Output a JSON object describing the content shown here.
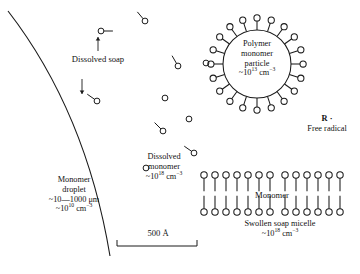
{
  "figure": {
    "type": "schematic-diagram",
    "background_color": "#ffffff",
    "line_color": "#1a1a1a"
  },
  "labels": {
    "dissolved_soap": "Dissolved soap",
    "dissolved_monomer_l1": "Dissolved",
    "dissolved_monomer_l2": "monomer",
    "dissolved_monomer_conc": "~10",
    "dissolved_monomer_conc_exp": "18",
    "dissolved_monomer_conc_unit": " cm",
    "dissolved_monomer_unit_exp": "−3",
    "monomer_droplet_l1": "Monomer",
    "monomer_droplet_l2": "droplet",
    "monomer_droplet_size": "~10—1000 μm",
    "monomer_droplet_conc": "~10",
    "monomer_droplet_conc_exp": "10",
    "monomer_droplet_unit": " cm",
    "monomer_droplet_unit_exp": "−3",
    "polymer_l1": "Polymer",
    "polymer_l2": "monomer",
    "polymer_l3": "particle",
    "polymer_conc": "~10",
    "polymer_conc_exp": "13",
    "polymer_unit": " cm",
    "polymer_unit_exp": "−3",
    "free_radical_symbol": "R ·",
    "free_radical_text": "Free radical",
    "monomer_mid": "Monomer",
    "micelle_title": "Swollen soap micelle",
    "micelle_conc": "~10",
    "micelle_conc_exp": "18",
    "micelle_unit": " cm",
    "micelle_unit_exp": "−3",
    "scale_value": "500 Å"
  },
  "chart_data": {
    "type": "scatter",
    "droplet_arc": {
      "description": "large monomer droplet boundary arc",
      "start": [
        8,
        11
      ],
      "control": [
        92,
        120
      ],
      "end": [
        110,
        256
      ]
    },
    "polymer_particle": {
      "center": [
        257,
        64
      ],
      "radius": 34,
      "soap_molecule_count": 20,
      "tail_length": 9,
      "head_radius": 3.1
    },
    "free_radical": {
      "x": 324,
      "y": 116
    },
    "scale_bar": {
      "x1": 117,
      "x2": 197,
      "y": 246,
      "tick_height": 6,
      "label": "500 Å"
    },
    "micelle": {
      "row_top_y": 175,
      "row_bottom_y": 212,
      "x_positions": [
        204,
        215,
        226,
        237,
        248,
        259,
        270,
        285,
        296,
        307,
        318,
        329,
        340
      ],
      "stem_length": 13,
      "head_radius": 3.2
    },
    "soap_molecules": [
      {
        "cx": 101,
        "cy": 31,
        "angle": 0
      },
      {
        "cx": 145,
        "cy": 21,
        "angle": 230
      },
      {
        "cx": 97,
        "cy": 101,
        "angle": 215
      },
      {
        "cx": 178,
        "cy": 66,
        "angle": 240
      },
      {
        "cx": 163,
        "cy": 131,
        "angle": 225
      },
      {
        "cx": 194,
        "cy": 153,
        "angle": 215
      }
    ],
    "monomer_dots": [
      {
        "cx": 165,
        "cy": 98
      },
      {
        "cx": 206,
        "cy": 63
      },
      {
        "cx": 189,
        "cy": 119
      },
      {
        "cx": 146,
        "cy": 168
      }
    ],
    "arrows": [
      {
        "name": "dissolved-soap-arrow",
        "x1": 98,
        "y1": 51,
        "x2": 98,
        "y2": 37
      },
      {
        "name": "dissolved-soap-arrow-2",
        "x1": 82,
        "y1": 79,
        "x2": 82,
        "y2": 94
      }
    ]
  }
}
